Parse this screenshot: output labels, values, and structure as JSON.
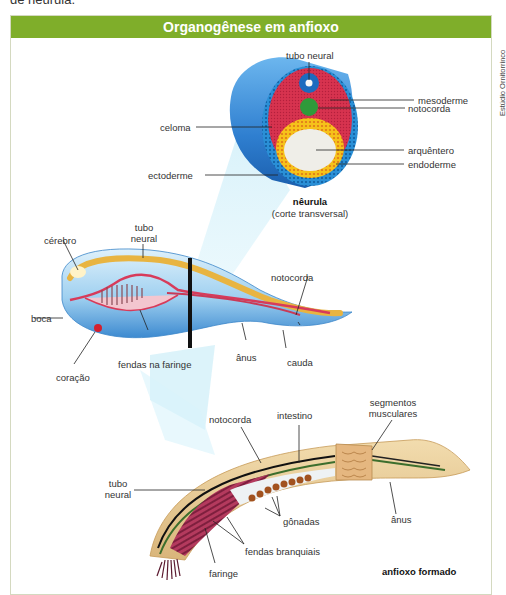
{
  "page": {
    "top_text_fragment": "de nêurula."
  },
  "figure": {
    "title": "Organogênese em anfioxo",
    "credit": "Estúdio Ornitorrinco",
    "header_color": "#7fae2a",
    "neurula": {
      "caption_title": "nêurula",
      "caption_subtitle": "(corte transversal)",
      "labels": {
        "tubo_neural": "tubo neural",
        "mesoderme": "mesoderme",
        "notocorda": "notocorda",
        "celoma": "celoma",
        "arquentero": "arquêntero",
        "endoderme": "endoderme",
        "ectoderme": "ectoderme"
      }
    },
    "embryo": {
      "labels": {
        "cerebro": "cérebro",
        "tubo_neural_1": "tubo",
        "tubo_neural_2": "neural",
        "notocorda": "notocorda",
        "boca": "boca",
        "fendas_faringe": "fendas na faringe",
        "anus": "ânus",
        "cauda": "cauda",
        "coracao": "coração"
      }
    },
    "adult": {
      "caption": "anfioxo formado",
      "labels": {
        "notocorda": "notocorda",
        "intestino": "intestino",
        "segmentos_1": "segmentos",
        "segmentos_2": "musculares",
        "tubo_neural_1": "tubo",
        "tubo_neural_2": "neural",
        "gonadas": "gônadas",
        "anus": "ânus",
        "fendas_branquiais": "fendas branquiais",
        "faringe": "faringe"
      }
    }
  }
}
